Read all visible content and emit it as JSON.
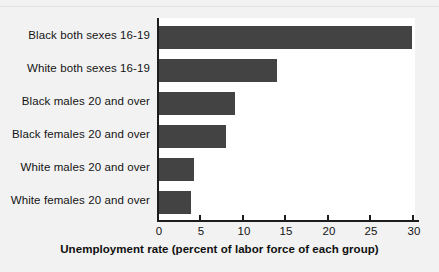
{
  "chart_data": {
    "type": "bar",
    "orientation": "horizontal",
    "title": "",
    "subtitle": "",
    "xlabel": "Unemployment rate (percent of labor force of each group)",
    "ylabel": "",
    "categories": [
      "Black both sexes 16-19",
      "White both sexes 16-19",
      "Black males 20 and over",
      "Black females 20 and over",
      "White males 20 and over",
      "White females 20 and over"
    ],
    "values": [
      30.0,
      14.1,
      9.2,
      8.1,
      4.3,
      4.0
    ],
    "xlim": [
      0,
      31
    ],
    "xticks": [
      0,
      5,
      10,
      15,
      20,
      25,
      30
    ],
    "xtick_labels": [
      "0",
      "5",
      "10",
      "15",
      "20",
      "25",
      "30"
    ],
    "grid": false,
    "legend": null,
    "series": [
      {
        "name": "Unemployment rate",
        "values": [
          30.0,
          14.1,
          9.2,
          8.1,
          4.3,
          4.0
        ]
      }
    ],
    "annotations": []
  },
  "style": {
    "bar_color": "#434343",
    "axis_color": "#1c1c1c",
    "plot_background": "#ffffff",
    "figure_background": "#f2f2f2",
    "text_color": "#141414"
  }
}
